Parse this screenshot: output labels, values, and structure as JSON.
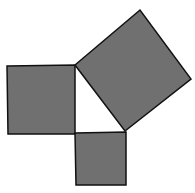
{
  "diagram": {
    "colors": {
      "background": "#ffffff",
      "fill": "#707070",
      "stroke": "#111111",
      "triangle": "#ffffff"
    },
    "shapes": {
      "left_square": {
        "points": "7,66 75,65 75,134 8,134"
      },
      "bottom_square": {
        "points": "75,133 126,132 126,185 76,185"
      },
      "hypotenuse_square": {
        "points": "75,65 140,10 191,79 125,131"
      },
      "triangle": {
        "points": "75,65 125,131 75,133"
      }
    }
  }
}
